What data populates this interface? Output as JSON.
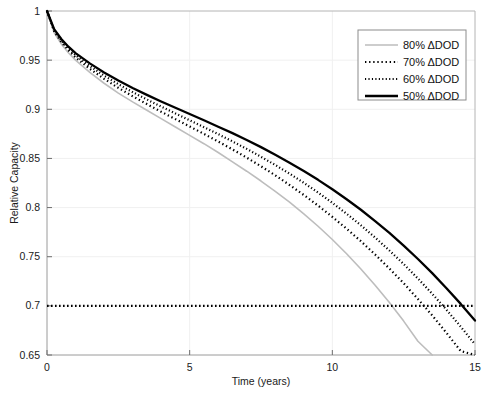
{
  "chart_data": {
    "type": "line",
    "title": "",
    "xlabel": "Time (years)",
    "ylabel": "Relative Capacity",
    "xlim": [
      0,
      15
    ],
    "ylim": [
      0.65,
      1
    ],
    "xticks": [
      "0",
      "5",
      "10",
      "15"
    ],
    "xtick_values": [
      0,
      5,
      10,
      15
    ],
    "yticks": [
      "0.65",
      "0.7",
      "0.75",
      "0.8",
      "0.85",
      "0.9",
      "0.95",
      "1"
    ],
    "ytick_values": [
      0.65,
      0.7,
      0.75,
      0.8,
      0.85,
      0.9,
      0.95,
      1
    ],
    "grid": true,
    "legend_position": "top-right",
    "x": [
      0,
      0.25,
      0.5,
      0.75,
      1,
      1.5,
      2,
      2.5,
      3,
      3.5,
      4,
      4.5,
      5,
      5.5,
      6,
      6.5,
      7,
      7.5,
      8,
      8.5,
      9,
      9.5,
      10,
      10.5,
      11,
      11.5,
      12,
      12.5,
      13,
      13.5,
      14,
      14.5,
      15
    ],
    "series": [
      {
        "name": "80% ΔDOD",
        "label": "80% ΔDOD",
        "color": "#bdbdbd",
        "style": "solid",
        "width": 1.6,
        "values": [
          1,
          0.978,
          0.9665,
          0.9575,
          0.95,
          0.9375,
          0.9265,
          0.9165,
          0.9075,
          0.899,
          0.8905,
          0.882,
          0.8735,
          0.865,
          0.856,
          0.8465,
          0.837,
          0.827,
          0.8165,
          0.8055,
          0.7935,
          0.781,
          0.7675,
          0.753,
          0.7375,
          0.721,
          0.7035,
          0.6845,
          0.664,
          0.65,
          null,
          null,
          null
        ]
      },
      {
        "name": "70% ΔDOD",
        "label": "70% ΔDOD",
        "color": "#000000",
        "style": "dotted",
        "width": 2.2,
        "values": [
          1,
          0.9795,
          0.9685,
          0.96,
          0.9528,
          0.9412,
          0.931,
          0.9218,
          0.9133,
          0.9053,
          0.8975,
          0.89,
          0.8825,
          0.875,
          0.8672,
          0.8592,
          0.8508,
          0.842,
          0.8328,
          0.823,
          0.8128,
          0.802,
          0.7905,
          0.7785,
          0.7658,
          0.7522,
          0.738,
          0.723,
          0.707,
          0.6903,
          0.6725,
          0.654,
          0.65
        ]
      },
      {
        "name": "60% ΔDOD",
        "label": "60% ΔDOD",
        "color": "#000000",
        "style": "fine-dotted",
        "width": 2.2,
        "values": [
          1,
          0.9805,
          0.97,
          0.9618,
          0.955,
          0.944,
          0.9343,
          0.9255,
          0.9175,
          0.91,
          0.9027,
          0.8957,
          0.8888,
          0.8818,
          0.8747,
          0.8673,
          0.8597,
          0.8517,
          0.8433,
          0.8345,
          0.8252,
          0.8153,
          0.8048,
          0.7937,
          0.782,
          0.7695,
          0.7563,
          0.7425,
          0.7278,
          0.7123,
          0.696,
          0.6788,
          0.6608
        ]
      },
      {
        "name": "50% ΔDOD",
        "label": "50% ΔDOD",
        "color": "#000000",
        "style": "solid",
        "width": 2.3,
        "values": [
          1,
          0.9815,
          0.9715,
          0.9637,
          0.9572,
          0.9467,
          0.9375,
          0.9292,
          0.9217,
          0.9147,
          0.908,
          0.9015,
          0.8952,
          0.8888,
          0.8823,
          0.8757,
          0.8688,
          0.8615,
          0.8538,
          0.8457,
          0.8372,
          0.8282,
          0.8187,
          0.8085,
          0.7978,
          0.7863,
          0.7742,
          0.7613,
          0.7477,
          0.7333,
          0.718,
          0.702,
          0.685
        ]
      }
    ],
    "threshold_line": {
      "name": "eol-threshold",
      "value": 0.7,
      "style": "dotted",
      "color": "#000000",
      "orientation": "horizontal"
    },
    "annotations": []
  }
}
